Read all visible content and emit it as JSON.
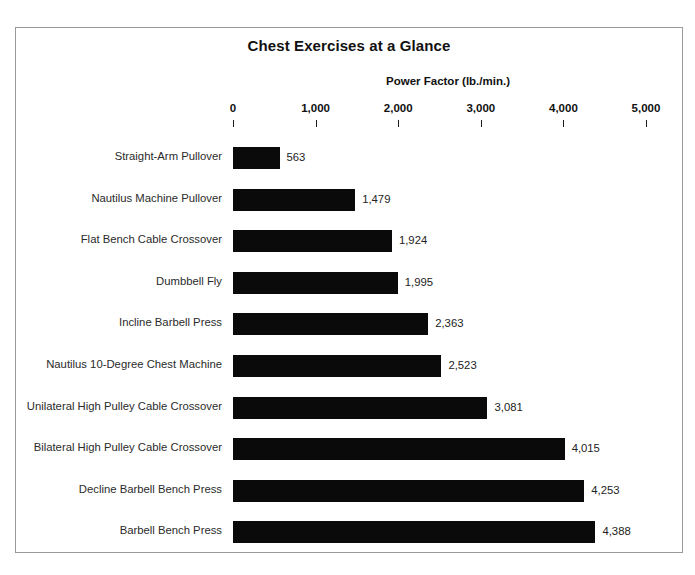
{
  "chart_data": {
    "type": "bar",
    "orientation": "horizontal",
    "title": "Chest Exercises at a Glance",
    "xlabel": "Power Factor (lb./min.)",
    "ylabel": "",
    "xlim": [
      0,
      5000
    ],
    "xticks": [
      0,
      1000,
      2000,
      3000,
      4000,
      5000
    ],
    "xtick_labels": [
      "0",
      "1,000",
      "2,000",
      "3,000",
      "4,000",
      "5,000"
    ],
    "grid": false,
    "legend": null,
    "bar_color": "#0a0a0a",
    "categories": [
      "Straight-Arm Pullover",
      "Nautilus Machine Pullover",
      "Flat Bench Cable Crossover",
      "Dumbbell Fly",
      "Incline Barbell Press",
      "Nautilus 10-Degree Chest Machine",
      "Unilateral High Pulley Cable Crossover",
      "Bilateral High Pulley Cable Crossover",
      "Decline Barbell Bench Press",
      "Barbell Bench Press"
    ],
    "values": [
      563,
      1479,
      1924,
      1995,
      2363,
      2523,
      3081,
      4015,
      4253,
      4388
    ],
    "value_labels": [
      "563",
      "1,479",
      "1,924",
      "1,995",
      "2,363",
      "2,523",
      "3,081",
      "4,015",
      "4,253",
      "4,388"
    ]
  }
}
